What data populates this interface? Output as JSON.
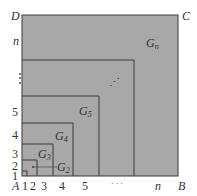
{
  "diagram": {
    "title": "",
    "corners": {
      "A": "A",
      "B": "B",
      "C": "C",
      "D": "D"
    },
    "fill_color": "#a8a8a8",
    "stroke_color": "#3a3a3a",
    "x_ticks": [
      "1",
      "2",
      "3",
      "4",
      "5",
      "· · ·",
      "n"
    ],
    "y_ticks": [
      "1",
      "2",
      "3",
      "4",
      "5",
      "⋮",
      "n"
    ],
    "regions": [
      {
        "name": "G",
        "sub": "2"
      },
      {
        "name": "G",
        "sub": "3"
      },
      {
        "name": "G",
        "sub": "4"
      },
      {
        "name": "G",
        "sub": "5"
      },
      {
        "name": "G",
        "sub": "n"
      }
    ],
    "diagonal_ellipsis": "⋰"
  }
}
